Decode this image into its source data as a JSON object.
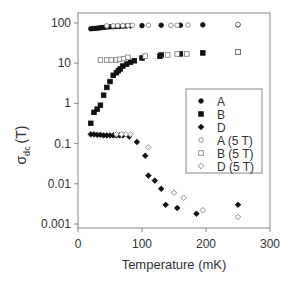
{
  "chart_data": {
    "type": "scatter",
    "title": "",
    "xlabel": "Temperature (mK)",
    "ylabel": "σ_dc (T)",
    "ylabel_main": "σ",
    "ylabel_sub": "dc",
    "ylabel_unit": "(T)",
    "xlim": [
      0,
      300
    ],
    "ylim": [
      0.001,
      100
    ],
    "yscale": "log",
    "xticks": [
      0,
      100,
      200,
      300
    ],
    "xtick_labels": [
      "0",
      "100",
      "200",
      "300"
    ],
    "yticks": [
      0.001,
      0.01,
      0.1,
      1,
      10,
      100
    ],
    "ytick_labels": [
      "0.001",
      "0.01",
      "0.1",
      "1",
      "10",
      "100"
    ],
    "grid": false,
    "legend_position": "right-center inside",
    "series": [
      {
        "name": "A",
        "marker": "filled-circle",
        "x": [
          20,
          23,
          26,
          29,
          32,
          35,
          38,
          42,
          46,
          50,
          55,
          60,
          65,
          70,
          75,
          82,
          100,
          130,
          160,
          195,
          250
        ],
        "y": [
          72,
          73,
          73,
          74,
          75,
          76,
          77,
          78,
          80,
          80,
          81,
          82,
          82,
          83,
          84,
          85,
          86,
          88,
          88,
          90,
          90
        ]
      },
      {
        "name": "B",
        "marker": "filled-square",
        "x": [
          20,
          25,
          30,
          35,
          40,
          45,
          50,
          55,
          60,
          63,
          66,
          70,
          76,
          82,
          88,
          100,
          128,
          130,
          160,
          195,
          250
        ],
        "y": [
          0.32,
          0.6,
          0.72,
          0.9,
          1.6,
          2.5,
          3.5,
          5.0,
          5.8,
          6.5,
          7.2,
          8.5,
          9.5,
          10.5,
          11.5,
          13.5,
          15,
          16,
          17,
          18,
          19
        ]
      },
      {
        "name": "D",
        "marker": "filled-diamond",
        "x": [
          20,
          25,
          30,
          35,
          40,
          45,
          50,
          55,
          60,
          65,
          70,
          80,
          92,
          105,
          110,
          120,
          130,
          137,
          155,
          185,
          250
        ],
        "y": [
          0.17,
          0.17,
          0.165,
          0.165,
          0.16,
          0.16,
          0.16,
          0.16,
          0.16,
          0.16,
          0.16,
          0.15,
          0.11,
          0.05,
          0.016,
          0.012,
          0.0075,
          0.003,
          0.0025,
          0.0018,
          0.003
        ]
      },
      {
        "name": "A (5 T)",
        "marker": "open-circle",
        "x": [
          45,
          55,
          62,
          70,
          78,
          85,
          110,
          145,
          155,
          172,
          250
        ],
        "y": [
          85,
          85,
          86,
          86,
          87,
          88,
          88,
          88,
          88,
          89,
          92
        ]
      },
      {
        "name": "B (5 T)",
        "marker": "open-square",
        "x": [
          35,
          45,
          52,
          60,
          65,
          72,
          78,
          105,
          140,
          155,
          170,
          250
        ],
        "y": [
          12,
          12,
          12,
          12,
          12.5,
          13,
          14,
          15,
          16,
          17,
          17,
          19
        ]
      },
      {
        "name": "D (5 T)",
        "marker": "open-diamond",
        "x": [
          60,
          68,
          75,
          82,
          110,
          150,
          165,
          195,
          250
        ],
        "y": [
          0.17,
          0.17,
          0.17,
          0.17,
          0.08,
          0.006,
          0.0045,
          0.0022,
          0.0015
        ]
      }
    ]
  }
}
